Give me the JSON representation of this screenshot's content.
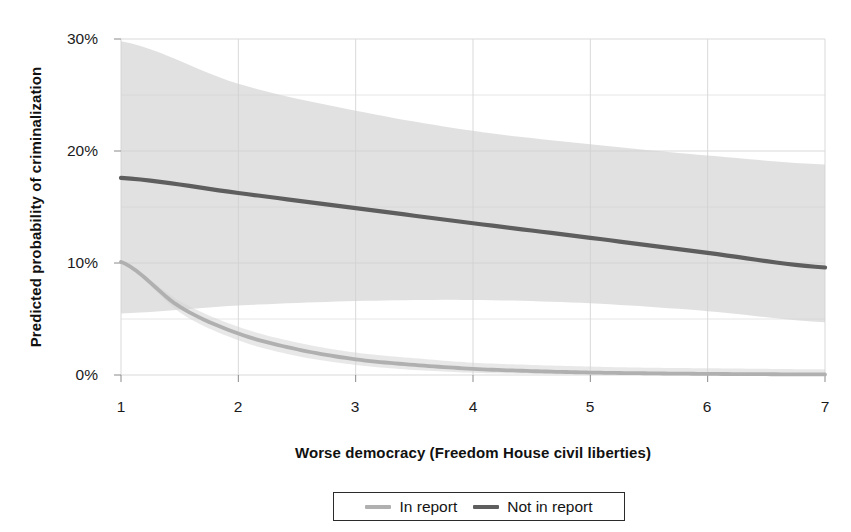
{
  "chart_data": {
    "type": "line",
    "title": "",
    "xlabel": "Worse democracy (Freedom House civil liberties)",
    "ylabel": "Predicted probability of criminalization",
    "xlim": [
      1,
      7
    ],
    "ylim": [
      0,
      30
    ],
    "grid": true,
    "legend_position": "bottom",
    "x_ticks": [
      "1",
      "2",
      "3",
      "4",
      "5",
      "6",
      "7"
    ],
    "x_tick_values": [
      1,
      2,
      3,
      4,
      5,
      6,
      7
    ],
    "y_ticks": [
      "0%",
      "10%",
      "20%",
      "30%"
    ],
    "y_tick_values": [
      0,
      10,
      20,
      30
    ],
    "y_minor_gridlines": [
      5,
      15,
      25
    ],
    "units": "percent",
    "series": [
      {
        "name": "In report",
        "color": "#b0b0b0",
        "x": [
          1,
          1.5,
          2,
          2.5,
          3,
          3.5,
          4,
          4.5,
          5,
          5.5,
          6,
          6.5,
          7
        ],
        "values": [
          10.1,
          6.1,
          3.7,
          2.3,
          1.4,
          0.9,
          0.55,
          0.35,
          0.22,
          0.15,
          0.1,
          0.07,
          0.05
        ],
        "band_upper": [
          10.1,
          6.6,
          4.3,
          2.9,
          2.0,
          1.5,
          1.1,
          0.9,
          0.75,
          0.65,
          0.6,
          0.55,
          0.5
        ],
        "band_lower": [
          10.1,
          5.6,
          3.1,
          1.7,
          0.9,
          0.45,
          0.2,
          0.1,
          0.05,
          0.02,
          0.0,
          0.0,
          0.0
        ]
      },
      {
        "name": "Not in report",
        "color": "#5e5e5e",
        "x": [
          1,
          2,
          3,
          4,
          5,
          6,
          7
        ],
        "values": [
          17.6,
          16.25,
          14.9,
          13.55,
          12.25,
          10.9,
          9.6
        ],
        "band_upper": [
          29.8,
          26.0,
          23.6,
          21.8,
          20.6,
          19.6,
          18.8
        ],
        "band_lower": [
          5.5,
          6.2,
          6.6,
          6.7,
          6.4,
          5.7,
          4.7
        ]
      }
    ]
  },
  "axes": {
    "y_title": "Predicted probability of criminalization",
    "x_title": "Worse democracy (Freedom House civil liberties)",
    "y_tick_labels": [
      "30%",
      "20%",
      "10%",
      "0%"
    ],
    "x_tick_labels": [
      "1",
      "2",
      "3",
      "4",
      "5",
      "6",
      "7"
    ]
  },
  "legend": {
    "entries": [
      {
        "label": "In report",
        "color": "#b0b0b0"
      },
      {
        "label": "Not in report",
        "color": "#5e5e5e"
      }
    ]
  },
  "colors": {
    "background": "#ffffff",
    "grid": "#d9d9d9",
    "grid_minor": "#e6e6e6",
    "band": "#cfcfcf",
    "band_light": "#d6d6d6",
    "text": "#1a1a1a",
    "in_report": "#b0b0b0",
    "not_in_report": "#5e5e5e"
  }
}
